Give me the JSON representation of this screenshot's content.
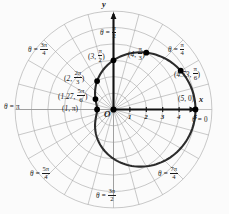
{
  "figure": {
    "type": "polar-graph",
    "curve_label": "limacon r = 3 + 2 cos(theta)",
    "axes": {
      "x_label": "x",
      "y_label": "y",
      "origin_label": "O"
    },
    "x_ticks": [
      "1",
      "2",
      "3",
      "4",
      "5"
    ]
  },
  "angle_labels": [
    {
      "name": "theta-0",
      "prefix": "θ =",
      "num": "0",
      "den": "",
      "plain": "0",
      "x": 192,
      "y": 117
    },
    {
      "name": "theta-pi-4",
      "prefix": "θ =",
      "num": "π",
      "den": "4",
      "plain": "",
      "x": 168,
      "y": 42
    },
    {
      "name": "theta-pi-2",
      "prefix": "θ =",
      "num": "π",
      "den": "2",
      "plain": "",
      "x": 100,
      "y": 25
    },
    {
      "name": "theta-3pi-4",
      "prefix": "θ =",
      "num": "3π",
      "den": "4",
      "plain": "",
      "x": 28,
      "y": 42
    },
    {
      "name": "theta-pi",
      "prefix": "θ =",
      "num": "",
      "den": "",
      "plain": "π",
      "x": 4,
      "y": 104
    },
    {
      "name": "theta-5pi-4",
      "prefix": "θ =",
      "num": "5π",
      "den": "4",
      "plain": "",
      "x": 30,
      "y": 166
    },
    {
      "name": "theta-3pi-2",
      "prefix": "θ =",
      "num": "3π",
      "den": "2",
      "plain": "",
      "x": 96,
      "y": 188
    },
    {
      "name": "theta-7pi-4",
      "prefix": "θ =",
      "num": "7π",
      "den": "4",
      "plain": "",
      "x": 158,
      "y": 166
    }
  ],
  "points": [
    {
      "name": "point-5-0",
      "r": "5",
      "theta_num": "",
      "theta_den": "",
      "theta_plain": "0",
      "lx": 178,
      "ly": 95,
      "px": 186,
      "py": 109
    },
    {
      "name": "point-473-pi-6",
      "r": "4.73",
      "theta_num": "π",
      "theta_den": "6",
      "theta_plain": "",
      "lx": 174,
      "ly": 66,
      "px": 174,
      "py": 73
    },
    {
      "name": "point-4-pi-3",
      "r": "4",
      "theta_num": "π",
      "theta_den": "3",
      "theta_plain": "",
      "lx": 128,
      "ly": 46,
      "px": 142,
      "py": 60
    },
    {
      "name": "point-3-pi-2",
      "r": "3",
      "theta_num": "π",
      "theta_den": "2",
      "theta_plain": "",
      "lx": 88,
      "ly": 48,
      "px": 113,
      "py": 63
    },
    {
      "name": "point-2-2pi-3",
      "r": "2",
      "theta_num": "2π",
      "theta_den": "3",
      "theta_plain": "",
      "lx": 64,
      "ly": 70,
      "px": 95,
      "py": 85
    },
    {
      "name": "point-127-5pi-6",
      "r": "1.27",
      "theta_num": "5π",
      "theta_den": "6",
      "theta_plain": "",
      "lx": 58,
      "ly": 88,
      "px": 95,
      "py": 98
    },
    {
      "name": "point-1-pi",
      "r": "1",
      "theta_num": "",
      "theta_den": "",
      "theta_plain": "π",
      "lx": 62,
      "ly": 105,
      "px": 98,
      "py": 109
    }
  ],
  "chart_data": {
    "type": "line",
    "title": "",
    "xlabel": "x",
    "ylabel": "y",
    "equation": "r = 3 + 2 cos(theta)",
    "coordinate_system": "polar",
    "r_axis_ticks": [
      1,
      2,
      3,
      4,
      5
    ],
    "theta_gridlines_deg": [
      0,
      15,
      30,
      45,
      60,
      75,
      90,
      105,
      120,
      135,
      150,
      165,
      180,
      195,
      210,
      225,
      240,
      255,
      270,
      285,
      300,
      315,
      330,
      345
    ],
    "marked_points": [
      {
        "r": 5.0,
        "theta": "0",
        "theta_deg": 0
      },
      {
        "r": 4.73,
        "theta": "pi/6",
        "theta_deg": 30
      },
      {
        "r": 4.0,
        "theta": "pi/3",
        "theta_deg": 60
      },
      {
        "r": 3.0,
        "theta": "pi/2",
        "theta_deg": 90
      },
      {
        "r": 2.0,
        "theta": "2pi/3",
        "theta_deg": 120
      },
      {
        "r": 1.27,
        "theta": "5pi/6",
        "theta_deg": 150
      },
      {
        "r": 1.0,
        "theta": "pi",
        "theta_deg": 180
      }
    ],
    "grid": true,
    "legend": "none"
  },
  "colors": {
    "curve": "#2b2b2b",
    "axis": "#111111",
    "grid": "#a8a8a8",
    "point": "#000000",
    "background": "#fbfbfb"
  }
}
